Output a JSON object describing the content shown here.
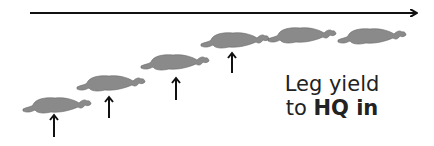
{
  "diagram": {
    "title_line1": "Leg yield",
    "title_line2_prefix": "to ",
    "title_line2_bold": "HQ in",
    "direction_arrow": {
      "x1": 30,
      "y": 13,
      "x2": 418,
      "color": "#111111"
    },
    "horse_color": "#8a8a8a",
    "horses": [
      {
        "x": 23,
        "y": 95
      },
      {
        "x": 77,
        "y": 73
      },
      {
        "x": 141,
        "y": 52
      },
      {
        "x": 201,
        "y": 30
      },
      {
        "x": 268,
        "y": 25
      },
      {
        "x": 338,
        "y": 26
      }
    ],
    "push_arrows": [
      {
        "x": 54,
        "y1": 137,
        "y2": 115
      },
      {
        "x": 109,
        "y1": 118,
        "y2": 97
      },
      {
        "x": 176,
        "y1": 100,
        "y2": 78
      },
      {
        "x": 232,
        "y1": 73,
        "y2": 53
      }
    ]
  }
}
